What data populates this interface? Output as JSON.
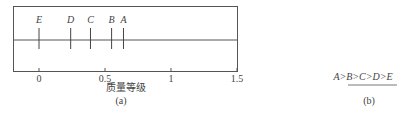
{
  "chart_data": {
    "type": "scatter",
    "title": "",
    "xlabel": "质量等级",
    "caption": "(a)",
    "xlim": [
      -0.2,
      1.5
    ],
    "xticks": [
      0,
      0.5,
      1,
      1.5
    ],
    "xtick_labels": [
      "0",
      "0.5",
      "1",
      "1.5"
    ],
    "points": [
      {
        "label": "E",
        "x": 0
      },
      {
        "label": "D",
        "x": 0.24
      },
      {
        "label": "C",
        "x": 0.39
      },
      {
        "label": "B",
        "x": 0.55
      },
      {
        "label": "A",
        "x": 0.64
      }
    ],
    "grid": false
  },
  "panel_b": {
    "ordering": "A>B>C>D>E",
    "caption": "(b)"
  }
}
